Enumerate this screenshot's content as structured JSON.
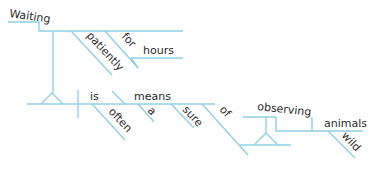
{
  "diagram": {
    "type": "sentence-diagram",
    "sentence": "Waiting patiently for hours is often a sure means of observing wild animals",
    "line_color": "#8fd0e6",
    "text_color": "#2a2a2a",
    "words": {
      "waiting": "Waiting",
      "patiently": "patiently",
      "for": "for",
      "hours": "hours",
      "is": "is",
      "often": "often",
      "means": "means",
      "a": "a",
      "sure": "sure",
      "of": "of",
      "observing": "observing",
      "animals": "animals",
      "wild": "wild"
    }
  }
}
